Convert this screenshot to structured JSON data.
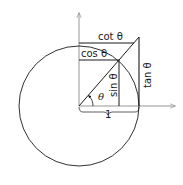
{
  "figure": {
    "type": "unit-circle-trigonometry",
    "labels": {
      "cot": "cot θ",
      "cos": "cos θ",
      "sin": "sin θ",
      "tan": "tan θ",
      "angle": "θ",
      "radius": "1"
    },
    "colors": {
      "stroke": "#1a1a1a",
      "axis": "#8a8a8a",
      "background": "#ffffff"
    },
    "geometry": {
      "center": [
        79,
        106
      ],
      "radius": 60,
      "angle_deg": 49.5
    }
  }
}
